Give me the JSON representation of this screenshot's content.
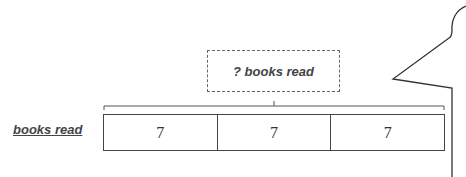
{
  "diagram": {
    "row_label": "books read",
    "total_label": "? books read",
    "segments": [
      {
        "value": "7"
      },
      {
        "value": "7"
      },
      {
        "value": "7"
      }
    ]
  }
}
